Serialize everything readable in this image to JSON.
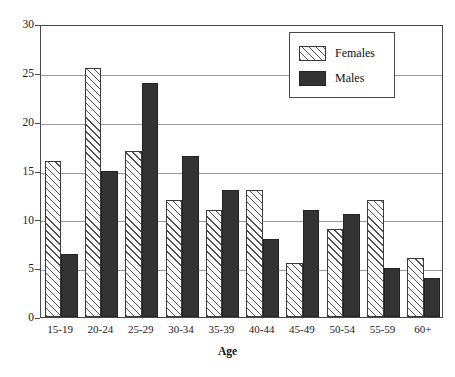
{
  "chart_data": {
    "type": "bar",
    "title": "",
    "xlabel": "Age",
    "ylabel": "",
    "categories": [
      "15-19",
      "20-24",
      "25-29",
      "30-34",
      "35-39",
      "40-44",
      "45-49",
      "50-54",
      "55-59",
      "60+"
    ],
    "series": [
      {
        "name": "Females",
        "values": [
          16,
          25.5,
          17,
          12,
          11,
          13,
          5.5,
          9,
          12,
          6
        ],
        "color": "#fbfbfb",
        "pattern": "diagonal-hatch"
      },
      {
        "name": "Males",
        "values": [
          6.5,
          15,
          24,
          16.5,
          13,
          8,
          11,
          10.5,
          5,
          4
        ],
        "color": "#333333",
        "pattern": "solid"
      }
    ],
    "ylim": [
      0,
      30
    ],
    "yticks": [
      0,
      5,
      10,
      15,
      20,
      25,
      30
    ],
    "ytick_labels": [
      "0",
      "5",
      "10",
      "15",
      "20",
      "25",
      "30"
    ],
    "grid": true,
    "grid_axis": "y",
    "legend_position": "top-right"
  },
  "legend": {
    "entries": [
      {
        "label": "Females"
      },
      {
        "label": "Males"
      }
    ]
  },
  "axis": {
    "x_title": "Age"
  }
}
